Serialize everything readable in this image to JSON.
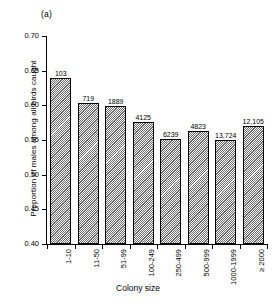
{
  "figure": {
    "panel_label": "(a)",
    "xlabel": "Colony size",
    "ylabel": "Proportion of males among all birds caught"
  },
  "chart_data": {
    "type": "bar",
    "title": "(a)",
    "xlabel": "Colony size",
    "ylabel": "Proportion of males among all birds caught",
    "ylim": [
      0.4,
      0.7
    ],
    "yticks": [
      "0.40",
      "0.45",
      "0.50",
      "0.55",
      "0.60",
      "0.65",
      "0.70"
    ],
    "ytick_values": [
      0.4,
      0.45,
      0.5,
      0.55,
      0.6,
      0.65,
      0.7
    ],
    "grid": false,
    "legend": "none",
    "categories": [
      "1-10",
      "11-50",
      "51-99",
      "100-249",
      "250-499",
      "500-999",
      "1000-1999",
      "≥ 2000"
    ],
    "values": [
      0.64,
      0.604,
      0.599,
      0.576,
      0.551,
      0.563,
      0.55,
      0.57
    ],
    "point_labels": [
      "103",
      "719",
      "1889",
      "4125",
      "6239",
      "4823",
      "13,724",
      "12,105"
    ],
    "bars": [
      {
        "category": "1-10",
        "value": 0.64,
        "label": "103"
      },
      {
        "category": "11-50",
        "value": 0.604,
        "label": "719"
      },
      {
        "category": "51-99",
        "value": 0.599,
        "label": "1889"
      },
      {
        "category": "100-249",
        "value": 0.576,
        "label": "4125"
      },
      {
        "category": "250-499",
        "value": 0.551,
        "label": "6239"
      },
      {
        "category": "500-999",
        "value": 0.563,
        "label": "4823"
      },
      {
        "category": "1000-1999",
        "value": 0.55,
        "label": "13,724"
      },
      {
        "category": "≥ 2000",
        "value": 0.57,
        "label": "12,105"
      }
    ]
  }
}
